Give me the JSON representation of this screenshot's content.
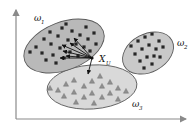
{
  "figure": {
    "type": "scatter-cluster-diagram",
    "background": "#ffffff",
    "axes": {
      "color": "#8a8a8a",
      "x_axis_name": "x-axis",
      "y_axis_name": "y-axis",
      "arrowheads": true,
      "tick_labels": []
    },
    "clusters": [
      {
        "id": "omega1",
        "label": "ω",
        "subscript": "1",
        "label_x": 34,
        "label_y": 21,
        "fill": "#b9b9b9",
        "stroke": "#5a5a5a",
        "marker": "square",
        "marker_color": "#262626",
        "cx": 64,
        "cy": 46,
        "rx": 42,
        "ry": 24,
        "rotation": -21,
        "points": [
          [
            36,
            47
          ],
          [
            44,
            39
          ],
          [
            42,
            53
          ],
          [
            50,
            32
          ],
          [
            51,
            44
          ],
          [
            53,
            55
          ],
          [
            58,
            36
          ],
          [
            60,
            48
          ],
          [
            62,
            28
          ],
          [
            64,
            58
          ],
          [
            68,
            40
          ],
          [
            70,
            52
          ],
          [
            72,
            31
          ],
          [
            76,
            44
          ],
          [
            78,
            56
          ],
          [
            80,
            35
          ],
          [
            84,
            47
          ],
          [
            86,
            27
          ],
          [
            88,
            39
          ],
          [
            90,
            51
          ],
          [
            94,
            33
          ],
          [
            96,
            44
          ],
          [
            46,
            60
          ],
          [
            56,
            63
          ],
          [
            66,
            24
          ],
          [
            30,
            52
          ]
        ]
      },
      {
        "id": "omega2",
        "label": "ω",
        "subscript": "2",
        "label_x": 177,
        "label_y": 46,
        "fill": "#c9c9c9",
        "stroke": "#5a5a5a",
        "marker": "square",
        "marker_color": "#262626",
        "cx": 148,
        "cy": 53,
        "rx": 27,
        "ry": 19,
        "rotation": -28,
        "points": [
          [
            131,
            46
          ],
          [
            138,
            41
          ],
          [
            145,
            37
          ],
          [
            152,
            34
          ],
          [
            159,
            41
          ],
          [
            135,
            54
          ],
          [
            142,
            49
          ],
          [
            149,
            45
          ],
          [
            156,
            49
          ],
          [
            163,
            47
          ],
          [
            140,
            61
          ],
          [
            147,
            57
          ],
          [
            154,
            56
          ],
          [
            144,
            68
          ],
          [
            152,
            64
          ],
          [
            160,
            57
          ]
        ]
      },
      {
        "id": "omega3",
        "label": "ω",
        "subscript": "3",
        "label_x": 132,
        "label_y": 107,
        "fill": "#d9d9d9",
        "stroke": "#5a5a5a",
        "marker": "triangle",
        "marker_color": "#8f8f8f",
        "cx": 92,
        "cy": 87,
        "rx": 45,
        "ry": 22,
        "rotation": -4,
        "points": [
          [
            58,
            90
          ],
          [
            66,
            84
          ],
          [
            64,
            96
          ],
          [
            74,
            80
          ],
          [
            74,
            92
          ],
          [
            76,
            102
          ],
          [
            84,
            86
          ],
          [
            84,
            97
          ],
          [
            92,
            81
          ],
          [
            92,
            93
          ],
          [
            94,
            103
          ],
          [
            102,
            86
          ],
          [
            102,
            97
          ],
          [
            110,
            82
          ],
          [
            110,
            93
          ],
          [
            118,
            88
          ],
          [
            118,
            99
          ],
          [
            126,
            91
          ],
          [
            50,
            88
          ],
          [
            100,
            76
          ]
        ]
      }
    ],
    "query_point": {
      "id": "x-u",
      "label": "X",
      "subscript": "U",
      "label_x": 99,
      "label_y": 62,
      "x": 92,
      "y": 58,
      "marker_color": "#111111"
    },
    "arrows": {
      "color": "#111111",
      "from": [
        92,
        58
      ],
      "targets": [
        [
          62,
          45
        ],
        [
          63,
          51
        ],
        [
          66,
          56
        ],
        [
          70,
          43
        ],
        [
          74,
          38
        ],
        [
          60,
          58
        ],
        [
          88,
          74
        ]
      ]
    }
  }
}
